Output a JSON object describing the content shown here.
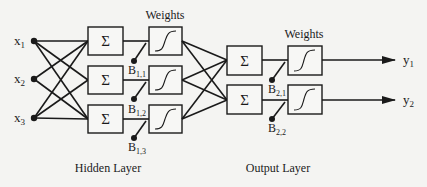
{
  "diagram": {
    "type": "neural-network-architecture",
    "inputs": [
      {
        "label": "x",
        "sub": "1"
      },
      {
        "label": "x",
        "sub": "2"
      },
      {
        "label": "x",
        "sub": "3"
      }
    ],
    "hidden_layer": {
      "label": "Hidden Layer",
      "weights_label": "Weights",
      "sum_symbol": "Σ",
      "biases": [
        {
          "label": "B",
          "sub": "1,1"
        },
        {
          "label": "B",
          "sub": "1,2"
        },
        {
          "label": "B",
          "sub": "1,3"
        }
      ]
    },
    "output_layer": {
      "label": "Output Layer",
      "weights_label": "Weights",
      "sum_symbol": "Σ",
      "biases": [
        {
          "label": "B",
          "sub": "2,1"
        },
        {
          "label": "B",
          "sub": "2,2"
        }
      ]
    },
    "outputs": [
      {
        "label": "y",
        "sub": "1"
      },
      {
        "label": "y",
        "sub": "2"
      }
    ]
  }
}
